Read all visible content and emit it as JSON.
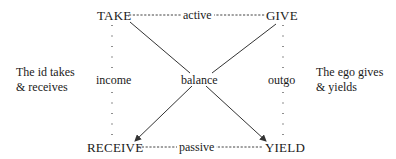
{
  "diagram": {
    "nodes": {
      "take": "TAKE",
      "give": "GIVE",
      "receive": "RECEIVE",
      "yield": "YIELD"
    },
    "edges": {
      "top": "active",
      "bottom": "passive",
      "left": "income",
      "right": "outgo",
      "center": "balance"
    },
    "side_notes": {
      "left_line1": "The id takes",
      "left_line2": "& receives",
      "right_line1": "The ego gives",
      "right_line2": "& yields"
    },
    "colors": {
      "text": "#1a1a1a",
      "line": "#333333",
      "background": "#ffffff"
    }
  }
}
